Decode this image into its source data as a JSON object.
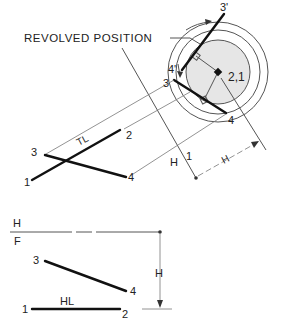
{
  "labels": {
    "revolved_position": "REVOLVED POSITION",
    "p3_prime": "3'",
    "p4_prime": "4'",
    "p21": "2,1",
    "p3_aux": "3",
    "p4_aux": "4",
    "top_3": "3",
    "top_2": "2",
    "top_1": "1",
    "top_4": "4",
    "tl": "TL",
    "fold_h": "H",
    "fold_1": "1",
    "dim_h_aux": "H",
    "fold_hf_h": "H",
    "fold_hf_f": "F",
    "front_3": "3",
    "front_4": "4",
    "front_1": "1",
    "front_2": "2",
    "hl": "HL",
    "dim_h_front": "H"
  },
  "colors": {
    "line": "#111111",
    "construction": "#777777",
    "shading": "#e6e6e6"
  }
}
